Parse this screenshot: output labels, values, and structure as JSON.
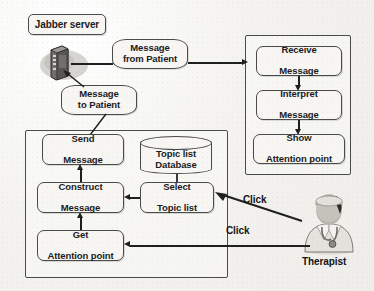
{
  "diagram": {
    "background_color": "#f2f1ea",
    "stroke_color": "#1f1f1f",
    "node_fill": "#f7f6f3",
    "nodes": {
      "jabber_server_label": "Jabber server",
      "message_from_patient": "Message\nfrom Patient",
      "message_from_patient_line1": "Message",
      "message_from_patient_line2": "from Patient",
      "message_to_patient_line1": "Message",
      "message_to_patient_line2": "to Patient",
      "receive_message_line1": "Receive",
      "receive_message_line2": "Message",
      "interpret_message_line1": "Interpret",
      "interpret_message_line2": "Message",
      "show_attention_point_line1": "Show",
      "show_attention_point_line2": "Attention point",
      "send_message_line1": "Send",
      "send_message_line2": "Message",
      "construct_message_line1": "Construct",
      "construct_message_line2": "Message",
      "get_attention_point_line1": "Get",
      "get_attention_point_line2": "Attention point",
      "topic_list_database_line1": "Topic list",
      "topic_list_database_line2": "Database",
      "select_topic_list_line1": "Select",
      "select_topic_list_line2": "Topic list"
    },
    "actors": {
      "therapist_label": "Therapist"
    },
    "edge_labels": {
      "click_upper": "Click",
      "click_lower": "Click"
    },
    "icons": {
      "server": "server-tower-icon",
      "database": "database-cylinder-icon",
      "therapist": "doctor-avatar-icon"
    }
  }
}
